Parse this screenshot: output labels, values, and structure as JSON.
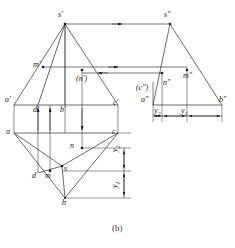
{
  "figure": {
    "caption": "(b)",
    "stroke_color": "#1a1a1a",
    "label_color": "#1a1a1a"
  },
  "views": {
    "front": {
      "name": "front-view",
      "labels": {
        "apex": "s'",
        "a": "a'",
        "b": "b'",
        "c": "c'",
        "d": "d'",
        "m": "m'",
        "n": "(n')"
      }
    },
    "top": {
      "name": "top-view",
      "labels": {
        "apex": "s",
        "a": "a",
        "b": "b",
        "c": "c",
        "d": "d",
        "m": "m",
        "n": "n"
      }
    },
    "side": {
      "name": "side-view",
      "labels": {
        "apex": "s\"",
        "a": "a\"",
        "b": "b\"",
        "c": "(c\")",
        "m": "m\"",
        "n": "n\""
      }
    }
  },
  "dimensions": {
    "y1": {
      "base": "y",
      "sub": "1"
    },
    "y2": {
      "base": "y",
      "sub": "2"
    }
  }
}
